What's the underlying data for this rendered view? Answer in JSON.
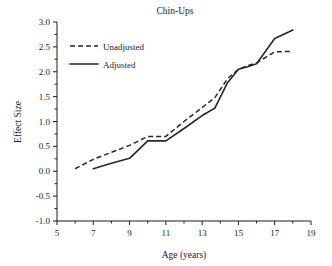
{
  "chart_data": {
    "type": "line",
    "title": "Chin-Ups",
    "xlabel": "Age (years)",
    "ylabel": "Effect Size",
    "xlim": [
      5,
      19
    ],
    "ylim": [
      -1.0,
      3.0
    ],
    "grid": false,
    "legend_position": "upper-left",
    "xticks": [
      5,
      7,
      9,
      11,
      13,
      15,
      17,
      19
    ],
    "xtick_labels": [
      "5",
      "7",
      "9",
      "11",
      "13",
      "15",
      "17",
      "19"
    ],
    "xminor_ticks": [
      6,
      8,
      10,
      12,
      14,
      16,
      18
    ],
    "yticks": [
      -1.0,
      -0.5,
      0.0,
      0.5,
      1.0,
      1.5,
      2.0,
      2.5,
      3.0
    ],
    "ytick_labels": [
      "-1.0",
      "-0.5",
      "0.0",
      "0.5",
      "1.0",
      "1.5",
      "2.0",
      "2.5",
      "3.0"
    ],
    "series": [
      {
        "name": "Unadjusted",
        "style": "dashed",
        "color": "#262626",
        "x": [
          6,
          7,
          8,
          9,
          10,
          11,
          12,
          13,
          13.7,
          14.4,
          15,
          15.5,
          16,
          17,
          18
        ],
        "values": [
          0.05,
          0.24,
          0.38,
          0.52,
          0.7,
          0.7,
          1.0,
          1.28,
          1.48,
          1.86,
          2.05,
          2.12,
          2.18,
          2.4,
          2.41
        ]
      },
      {
        "name": "Adjusted",
        "style": "solid",
        "color": "#262626",
        "x": [
          7,
          8,
          9,
          10,
          11,
          12,
          13,
          13.7,
          14.4,
          15,
          15.5,
          16,
          17,
          18
        ],
        "values": [
          0.05,
          0.16,
          0.26,
          0.61,
          0.61,
          0.86,
          1.12,
          1.27,
          1.78,
          2.05,
          2.1,
          2.16,
          2.67,
          2.84
        ]
      }
    ]
  },
  "legend": {
    "entries": [
      {
        "label": "Unadjusted",
        "style": "dashed"
      },
      {
        "label": "Adjusted",
        "style": "solid"
      }
    ]
  }
}
